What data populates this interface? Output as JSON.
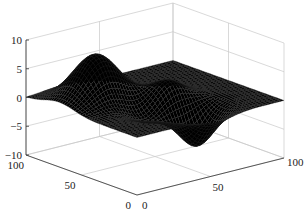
{
  "chart_data": {
    "type": "surface",
    "title": "",
    "xlabel": "",
    "ylabel": "",
    "zlabel": "",
    "xlim": [
      0,
      100
    ],
    "ylim": [
      0,
      100
    ],
    "zlim": [
      -10,
      10
    ],
    "x_ticks": [
      "0",
      "50",
      "100"
    ],
    "y_ticks": [
      "0",
      "50",
      "100"
    ],
    "z_ticks": [
      "-10",
      "-5",
      "0",
      "5",
      "10"
    ],
    "grid": true,
    "surface_color": "#000000",
    "grid_color": "#c8c8c8",
    "features": [
      {
        "kind": "peak",
        "x": 25,
        "y": 70,
        "z": 8
      },
      {
        "kind": "peak",
        "x": 55,
        "y": 45,
        "z": 3.5
      },
      {
        "kind": "trough",
        "x": 55,
        "y": 20,
        "z": -6.5
      },
      {
        "kind": "trough",
        "x": 35,
        "y": 40,
        "z": -2.5
      }
    ]
  }
}
